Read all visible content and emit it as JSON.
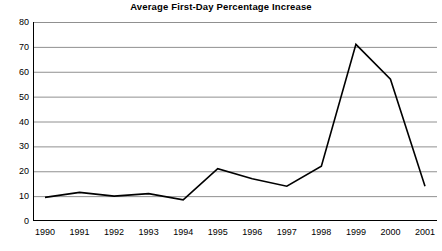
{
  "chart_data": {
    "type": "line",
    "title": "Average First-Day Percentage Increase",
    "xlabel": "",
    "ylabel": "",
    "categories": [
      "1990",
      "1991",
      "1992",
      "1993",
      "1994",
      "1995",
      "1996",
      "1997",
      "1998",
      "1999",
      "2000",
      "2001"
    ],
    "values": [
      9.5,
      11.5,
      10,
      11,
      8.5,
      21,
      17,
      14,
      22,
      71,
      57,
      14
    ],
    "series": [
      {
        "name": "Average First-Day Percentage Increase",
        "values": [
          9.5,
          11.5,
          10,
          11,
          8.5,
          21,
          17,
          14,
          22,
          71,
          57,
          14
        ]
      }
    ],
    "ylim": [
      0,
      80
    ],
    "y_ticks": [
      0,
      10,
      20,
      30,
      40,
      50,
      60,
      70,
      80
    ],
    "y_tick_labels": [
      "0",
      "10",
      "20",
      "30",
      "40",
      "50",
      "60",
      "70",
      "80"
    ],
    "grid": true,
    "grid_axis": "y",
    "legend": false,
    "line_color": "#000000",
    "grid_color": "#909090",
    "axis_color": "#000000",
    "background_color": "#ffffff"
  }
}
